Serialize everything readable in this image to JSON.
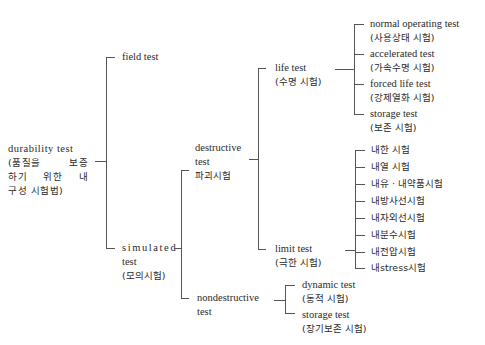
{
  "diagram": {
    "type": "tree",
    "root": {
      "line1": "durability test",
      "line2a": "(품질을",
      "line2b": "보증",
      "line3a": "하기",
      "line3b": "위한",
      "line3c": "내",
      "line4": "구성 시험법)"
    },
    "level1": {
      "field": "field test",
      "simulated": {
        "line1": "simulated",
        "line2": "test",
        "line3": "(모의시험)"
      }
    },
    "level2": {
      "destructive": {
        "line1": "destructive",
        "line2": "test",
        "line3": "파괴시험"
      },
      "nondestructive": {
        "line1": "nondestructive",
        "line2": "test"
      }
    },
    "level3": {
      "life": {
        "line1": "life test",
        "line2": "(수명 시험)"
      },
      "limit": {
        "line1": "limit test",
        "line2": "(극한 시험)"
      },
      "dynamic": {
        "line1": "dynamic test",
        "line2": "(동적 시험)"
      },
      "storage_long": {
        "line1": "storage test",
        "line2": "(장기보존 시험)"
      }
    },
    "life_children": [
      {
        "line1": "normal operating test",
        "line2": "(사용상태 시험)"
      },
      {
        "line1": "accelerated test",
        "line2": "(가속수명 시험)"
      },
      {
        "line1": "forced life test",
        "line2": "(강제열화 시험)"
      },
      {
        "line1": "storage test",
        "line2": "(보존 시험)"
      }
    ],
    "limit_children": [
      "내한 시험",
      "내열 시험",
      "내유 · 내약품시험",
      "내방사선시험",
      "내자외선시험",
      "내분수시험",
      "내전압시험",
      "내stress시험"
    ]
  }
}
